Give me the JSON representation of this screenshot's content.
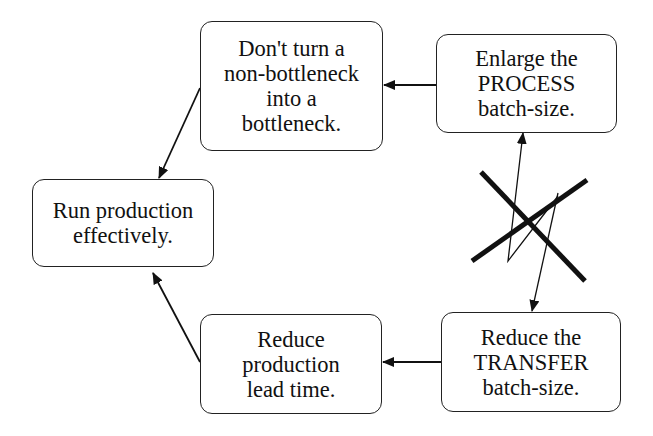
{
  "diagram": {
    "type": "flow",
    "nodes": [
      {
        "id": "dont_turn",
        "lines": [
          "Don't turn a",
          "non-bottleneck",
          "into a",
          "bottleneck."
        ]
      },
      {
        "id": "enlarge_process",
        "lines": [
          "Enlarge the",
          "PROCESS",
          "batch-size."
        ]
      },
      {
        "id": "run_production",
        "lines": [
          "Run production",
          "effectively."
        ]
      },
      {
        "id": "reduce_lead_time",
        "lines": [
          "Reduce",
          "production",
          "lead time."
        ]
      },
      {
        "id": "reduce_transfer",
        "lines": [
          "Reduce the",
          "TRANSFER",
          "batch-size."
        ]
      }
    ],
    "edges": [
      {
        "from": "enlarge_process",
        "to": "dont_turn"
      },
      {
        "from": "dont_turn",
        "to": "run_production"
      },
      {
        "from": "reduce_transfer",
        "to": "reduce_lead_time"
      },
      {
        "from": "reduce_lead_time",
        "to": "run_production"
      },
      {
        "from": "enlarge_process",
        "to": "reduce_transfer",
        "bidirectional": true,
        "style": "zigzag",
        "crossed_out": true
      }
    ],
    "annotations": [
      {
        "type": "cross-mark",
        "meaning": "conflict between process and transfer batch-size"
      }
    ],
    "colors": {
      "stroke": "#111111",
      "background": "#ffffff"
    }
  }
}
